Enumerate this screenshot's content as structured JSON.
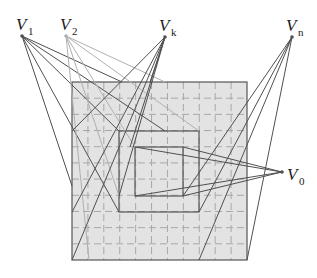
{
  "figure": {
    "colors": {
      "background": "#ffffff",
      "grid_fill": "#e3e3e3",
      "grid_dash": "#a8a8a8",
      "square_stroke": "#555555",
      "ray_dark": "#505050",
      "ray_light": "#b0b0b0"
    },
    "viewpoints": [
      {
        "id": "V1",
        "letter": "V",
        "subscript": "1",
        "x": 22,
        "y": 36,
        "shade": "dark"
      },
      {
        "id": "V2",
        "letter": "V",
        "subscript": "2",
        "x": 66,
        "y": 36,
        "shade": "light"
      },
      {
        "id": "Vk",
        "letter": "V",
        "subscript": "k",
        "x": 165,
        "y": 37,
        "shade": "dark"
      },
      {
        "id": "Vn",
        "letter": "V",
        "subscript": "n",
        "x": 292,
        "y": 37,
        "shade": "dark"
      },
      {
        "id": "V0",
        "letter": "V",
        "subscript": "0",
        "x": 282,
        "y": 172,
        "shade": "dark"
      }
    ],
    "squares": {
      "outer": {
        "x": 72,
        "y": 82,
        "w": 175,
        "h": 178
      },
      "middle": {
        "x": 119,
        "y": 131,
        "w": 80,
        "h": 81
      },
      "inner": {
        "x": 135,
        "y": 147,
        "w": 48,
        "h": 49
      }
    },
    "grid": {
      "cols": 11,
      "rows": 11
    }
  }
}
